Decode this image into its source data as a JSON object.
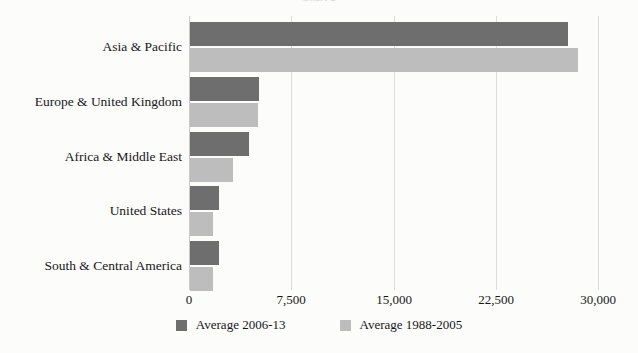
{
  "title_remnant": "Chart 2",
  "colors": {
    "series_dark": "#6e6e6e",
    "series_light": "#bdbdbd",
    "gridline": "#dcdcdc",
    "axis": "#c9c9c9",
    "background": "#fcfcfb",
    "text": "#17171a"
  },
  "legend": {
    "position": "bottom",
    "items": [
      {
        "label": "Average 2006-13",
        "color": "#6e6e6e",
        "swatch_name": "legend-swatch-average-2006-13"
      },
      {
        "label": "Average 1988-2005",
        "color": "#bdbdbd",
        "swatch_name": "legend-swatch-average-1988-2005"
      }
    ]
  },
  "chart_data": {
    "type": "bar",
    "orientation": "horizontal",
    "title": "",
    "xlabel": "",
    "ylabel": "",
    "xlim": [
      0,
      30000
    ],
    "grid": true,
    "legend_position": "bottom",
    "categories": [
      "Asia & Pacific",
      "Europe & United Kingdom",
      "Africa & Middle East",
      "United States",
      "South & Central America"
    ],
    "tick_values": [
      0,
      7500,
      15000,
      22500,
      30000
    ],
    "tick_labels": [
      "0",
      "7,500",
      "15,000",
      "22,500",
      "30,000"
    ],
    "series": [
      {
        "name": "Average 2006-13",
        "color": "#6e6e6e",
        "values": [
          27730,
          5060,
          4330,
          2130,
          2130
        ]
      },
      {
        "name": "Average 1988-2005",
        "color": "#bdbdbd",
        "values": [
          28460,
          4990,
          3150,
          1690,
          1690
        ]
      }
    ]
  }
}
